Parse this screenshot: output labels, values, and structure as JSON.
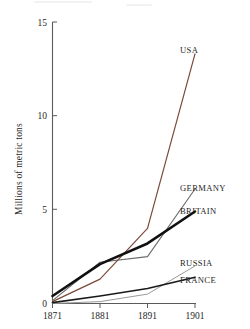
{
  "chart_data": {
    "type": "line",
    "title": "",
    "xlabel": "",
    "ylabel": "Millions of metric tons",
    "x": [
      1871,
      1881,
      1891,
      1901
    ],
    "xticklabels": [
      "1871",
      "1881",
      "1891",
      "1901"
    ],
    "yticklabels": [
      "0",
      "5",
      "10",
      "15"
    ],
    "yticks": [
      0,
      5,
      10,
      15
    ],
    "ylim": [
      0,
      15
    ],
    "xlim": [
      1871,
      1901
    ],
    "grid": false,
    "legend_position": "right-of-line-ends",
    "series": [
      {
        "name": "USA",
        "label": "USA",
        "color": "#7a4a3a",
        "width": 1.2,
        "values": [
          0.1,
          1.3,
          4.0,
          13.3
        ]
      },
      {
        "name": "GERMANY",
        "label": "GERMANY",
        "color": "#6b6b6b",
        "width": 1.1,
        "values": [
          0.15,
          2.2,
          2.5,
          6.1
        ]
      },
      {
        "name": "BRITAIN",
        "label": "BRITAIN",
        "color": "#111111",
        "width": 2.6,
        "values": [
          0.4,
          2.1,
          3.2,
          4.9
        ]
      },
      {
        "name": "RUSSIA",
        "label": "RUSSIA",
        "color": "#9a9a9a",
        "width": 1.0,
        "values": [
          0.0,
          0.1,
          0.5,
          2.0
        ]
      },
      {
        "name": "FRANCE",
        "label": "FRANCE",
        "color": "#1a1a1a",
        "width": 1.7,
        "values": [
          0.05,
          0.4,
          0.8,
          1.4
        ]
      }
    ]
  },
  "axes": {
    "y_axis_title": "Millions of metric tons",
    "y_ticks": [
      {
        "label": "15",
        "value": 15
      },
      {
        "label": "10",
        "value": 10
      },
      {
        "label": "5",
        "value": 5
      },
      {
        "label": "0",
        "value": 0
      }
    ],
    "x_ticks": [
      {
        "label": "1871",
        "value": 1871
      },
      {
        "label": "1881",
        "value": 1881
      },
      {
        "label": "1891",
        "value": 1891
      },
      {
        "label": "1901",
        "value": 1901
      }
    ]
  },
  "labels": {
    "usa": "USA",
    "germany": "GERMANY",
    "britain": "BRITAIN",
    "russia": "RUSSIA",
    "france": "FRANCE"
  }
}
